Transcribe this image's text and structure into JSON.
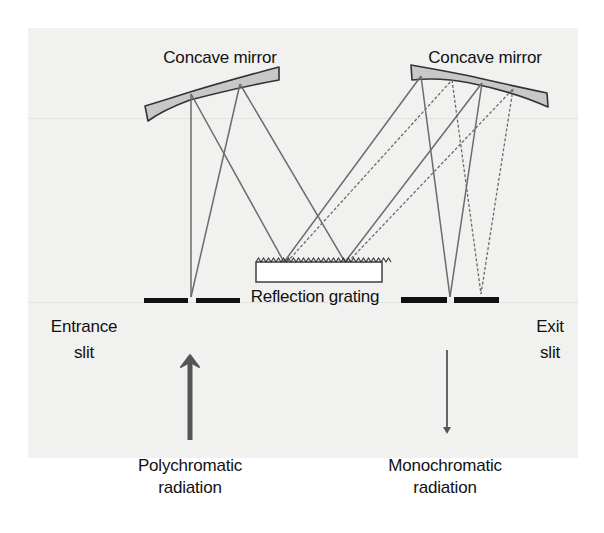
{
  "diagram": {
    "labels": {
      "left_mirror": "Concave mirror",
      "right_mirror": "Concave mirror",
      "grating": "Reflection grating",
      "entrance_slit_line1": "Entrance",
      "entrance_slit_line2": "slit",
      "exit_slit_line1": "Exit",
      "exit_slit_line2": "slit",
      "input_line1": "Polychromatic",
      "input_line2": "radiation",
      "output_line1": "Monochromatic",
      "output_line2": "radiation"
    },
    "colors": {
      "background_panel": "#f1f1f0",
      "mirror_fill": "#c8c8c8",
      "ray": "#6b6b6b",
      "slit": "#111111",
      "arrow": "#555555",
      "text": "#111111"
    },
    "legend": {
      "solid_rays": "wavelength 1",
      "dashed_rays": "wavelength 2"
    }
  }
}
